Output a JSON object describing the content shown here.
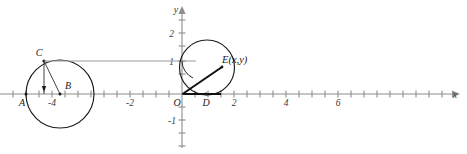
{
  "figure": {
    "background_color": "#ffffff",
    "width": 467,
    "height": 154
  },
  "axes": {
    "x_axis_name": "x",
    "y_axis_name": "y",
    "origin_label": "O",
    "axis_color": "#8d8d8d",
    "origin_px": {
      "x": 182,
      "y": 94
    },
    "unit_px": 26,
    "tick_step_units": 0.5,
    "x_range_units": [
      -7.0,
      10.6
    ],
    "y_range_units": [
      -2.4,
      2.9
    ],
    "x_tick_labels": [
      {
        "text": "-4",
        "value": -4
      },
      {
        "text": "-2",
        "value": -2
      },
      {
        "text": "2",
        "value": 2
      },
      {
        "text": "4",
        "value": 4
      },
      {
        "text": "6",
        "value": 6
      }
    ],
    "y_tick_labels": [
      {
        "text": "2",
        "value": 2
      },
      {
        "text": "1",
        "value": 1
      },
      {
        "text": "-1",
        "value": -1
      }
    ]
  },
  "points": {
    "A": {
      "label": "A",
      "value_units": {
        "x": -6.0,
        "y": 0
      }
    },
    "B": {
      "label": "B",
      "value_units": {
        "x": -4.7,
        "y": 0
      }
    },
    "C": {
      "label": "C",
      "value_units": {
        "x": -5.3,
        "y": 1.27
      }
    },
    "D": {
      "label": "D",
      "value_units": {
        "x": 0.92,
        "y": 0
      }
    },
    "E": {
      "label": "E(x,y)",
      "value_units": {
        "x": 1.55,
        "y": 1.05
      }
    },
    "O": {
      "label": "O",
      "value_units": {
        "x": 0,
        "y": 0
      }
    }
  },
  "shapes": {
    "left_circle": {
      "name": "left-circle",
      "center_units": {
        "x": -4.7,
        "y": 0
      },
      "radius_units": 1.3,
      "stroke": "#1a1a1a"
    },
    "right_circle": {
      "name": "unit-circle",
      "center_units": {
        "x": 0.95,
        "y": 1.0
      },
      "radius_units": 1.05,
      "stroke": "#1a1a1a"
    },
    "radius_segment_BC": {
      "name": "segment-b-c"
    },
    "perpendicular_segment_C": {
      "name": "segment-c-foot"
    },
    "radius_segment_OE": {
      "name": "segment-o-e"
    },
    "base_segment_OD": {
      "name": "segment-o-d"
    },
    "connector_C_to_y": {
      "name": "connector-c-to-yaxis",
      "stroke": "#9a9a9a"
    },
    "angle_arc": {
      "name": "angle-arc-at-origin"
    }
  }
}
